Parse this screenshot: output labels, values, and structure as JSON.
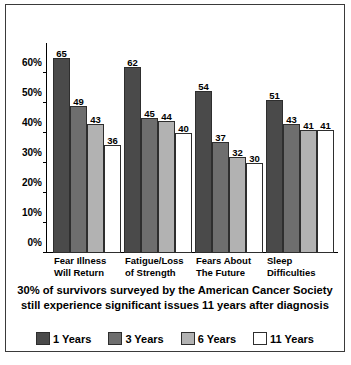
{
  "chart_data": {
    "type": "bar",
    "title": "",
    "xlabel": "",
    "ylabel": "",
    "ylim": [
      0,
      70
    ],
    "ytick_labels": [
      "0%",
      "10%",
      "20%",
      "30%",
      "40%",
      "50%",
      "60%"
    ],
    "ytick_values": [
      0,
      10,
      20,
      30,
      40,
      50,
      60
    ],
    "grid": false,
    "legend_position": "bottom",
    "categories": [
      "Fear Illness Will Return",
      "Fatigue/Loss of Strength",
      "Fears About The Future",
      "Sleep Difficulties"
    ],
    "category_lines": [
      [
        "Fear Illness",
        "Will Return"
      ],
      [
        "Fatigue/Loss",
        "of Strength"
      ],
      [
        "Fears About",
        "The Future"
      ],
      [
        "Sleep",
        "Difficulties"
      ]
    ],
    "series": [
      {
        "name": "1 Years",
        "color": "#4a4a4a",
        "values": [
          65,
          62,
          54,
          51
        ]
      },
      {
        "name": "3 Years",
        "color": "#6e6e6e",
        "values": [
          49,
          45,
          37,
          43
        ]
      },
      {
        "name": "6 Years",
        "color": "#b2b2b2",
        "values": [
          43,
          44,
          32,
          41
        ]
      },
      {
        "name": "11 Years",
        "color": "#ffffff",
        "values": [
          36,
          40,
          30,
          41
        ]
      }
    ],
    "caption_lines": [
      "30% of survivors surveyed by the American Cancer Society",
      "still experience significant issues 11 years after diagnosis"
    ]
  }
}
